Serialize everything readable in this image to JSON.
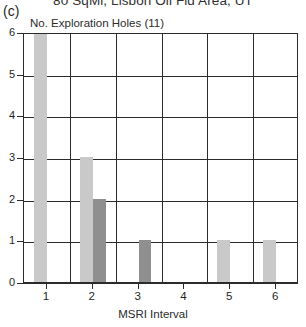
{
  "panel": {
    "label": "(c)"
  },
  "chart_data": {
    "type": "bar",
    "title": "80 SqMi, Lisbon Oil Fld Area, UT",
    "subtitle": "No. Exploration Holes (11)",
    "xlabel": "MSRI Interval",
    "ylabel": "",
    "categories": [
      "1",
      "2",
      "3",
      "4",
      "5",
      "6"
    ],
    "xlim": [
      0.5,
      6.5
    ],
    "ylim": [
      0,
      6
    ],
    "yticks": [
      0,
      1,
      2,
      3,
      4,
      5,
      6
    ],
    "ytick_labels": [
      "0",
      "1",
      "2",
      "3",
      "4",
      "5",
      "6"
    ],
    "grid": true,
    "legend": "none",
    "series": [
      {
        "name": "light",
        "color": "#c9c9c9",
        "values": [
          6,
          3,
          0,
          0,
          1,
          1
        ]
      },
      {
        "name": "dark",
        "color": "#8f8f8f",
        "values": [
          0,
          2,
          1,
          0,
          0,
          0
        ]
      }
    ],
    "bars": [
      {
        "interval": "1",
        "series": "light",
        "value": 6,
        "color": "#c9c9c9",
        "x0": 0.72,
        "x1": 1.0
      },
      {
        "interval": "2",
        "series": "light",
        "value": 3,
        "color": "#c9c9c9",
        "x0": 1.72,
        "x1": 2.0
      },
      {
        "interval": "2",
        "series": "dark",
        "value": 2,
        "color": "#8f8f8f",
        "x0": 2.0,
        "x1": 2.28
      },
      {
        "interval": "3",
        "series": "dark",
        "value": 1,
        "color": "#8f8f8f",
        "x0": 3.0,
        "x1": 3.28
      },
      {
        "interval": "5",
        "series": "light",
        "value": 1,
        "color": "#c9c9c9",
        "x0": 4.72,
        "x1": 5.0
      },
      {
        "interval": "6",
        "series": "light",
        "value": 1,
        "color": "#c9c9c9",
        "x0": 5.72,
        "x1": 6.0
      }
    ],
    "colors": {
      "light_bar": "#c9c9c9",
      "dark_bar": "#8f8f8f",
      "axis": "#2b2b2b",
      "background": "#ffffff"
    }
  }
}
